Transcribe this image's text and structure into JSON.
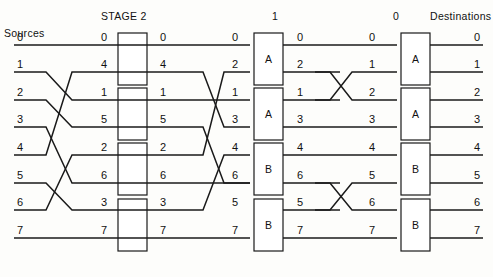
{
  "figure": {
    "type": "network-switching-diagram",
    "headers": {
      "sources": "Sources",
      "destinations": "Destinations",
      "stage2": "STAGE 2",
      "stage1": "1",
      "stage0": "0"
    },
    "columns": [
      {
        "name": "sources",
        "labels": [
          "0",
          "1",
          "2",
          "3",
          "4",
          "5",
          "6",
          "7"
        ]
      },
      {
        "name": "stage2-input",
        "labels": [
          "0",
          "4",
          "1",
          "5",
          "2",
          "6",
          "3",
          "7"
        ]
      },
      {
        "name": "stage2-output",
        "labels": [
          "0",
          "4",
          "1",
          "5",
          "2",
          "6",
          "3",
          "7"
        ]
      },
      {
        "name": "stage1-input",
        "labels": [
          "0",
          "2",
          "1",
          "3",
          "4",
          "6",
          "5",
          "7"
        ]
      },
      {
        "name": "stage1-output",
        "labels": [
          "0",
          "2",
          "1",
          "3",
          "4",
          "6",
          "5",
          "7"
        ]
      },
      {
        "name": "stage0-input",
        "labels": [
          "0",
          "1",
          "2",
          "3",
          "4",
          "5",
          "6",
          "7"
        ]
      },
      {
        "name": "destinations",
        "labels": [
          "0",
          "1",
          "2",
          "3",
          "4",
          "5",
          "6",
          "7"
        ]
      }
    ],
    "switch_boxes": {
      "stage2": [
        "",
        "",
        "",
        ""
      ],
      "stage1": [
        "A",
        "A",
        "B",
        "B"
      ],
      "stage0": [
        "A",
        "A",
        "B",
        "B"
      ]
    },
    "colors": {
      "line": "#1a1a1a",
      "box_fill": "#ffffff",
      "background": "#fdfdfb",
      "text": "#111111"
    }
  }
}
